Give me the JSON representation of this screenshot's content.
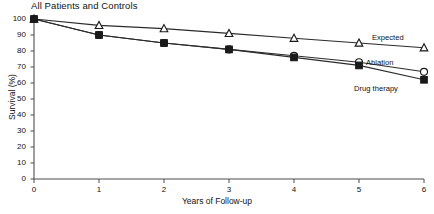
{
  "chart_data": {
    "type": "line",
    "title": "All Patients and Controls",
    "xlabel": "Years of Follow-up",
    "ylabel": "Survival (%)",
    "x": [
      0,
      1,
      2,
      3,
      4,
      5,
      6
    ],
    "xlim": [
      0,
      6
    ],
    "ylim": [
      0,
      100
    ],
    "xticks": [
      "0",
      "1",
      "2",
      "3",
      "4",
      "5",
      "6"
    ],
    "yticks": [
      "0",
      "10",
      "20",
      "30",
      "40",
      "50",
      "60",
      "70",
      "80",
      "90",
      "100"
    ],
    "grid": false,
    "legend_position": "right-inline",
    "series": [
      {
        "name": "Expected",
        "marker": "triangle-open",
        "values": [
          100,
          96,
          94,
          91,
          88,
          85,
          82
        ]
      },
      {
        "name": "Ablation",
        "marker": "circle-open",
        "values": [
          100,
          90,
          85,
          81,
          77,
          73,
          67
        ]
      },
      {
        "name": "Drug therapy",
        "marker": "square-solid",
        "values": [
          100,
          90,
          85,
          81,
          76,
          71,
          62
        ]
      }
    ],
    "colors": {
      "line": "#2b2b2b",
      "axis": "#4d4d4d",
      "text": "#111111",
      "marker_fill_open": "#ffffff",
      "marker_fill_solid": "#1a1a1a"
    }
  }
}
